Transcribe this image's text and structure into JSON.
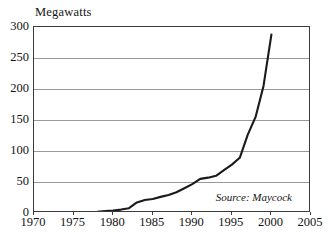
{
  "chart_data": {
    "type": "line",
    "title": "Megawatts",
    "xlabel": "",
    "ylabel": "Megawatts",
    "xlim": [
      1970,
      2005
    ],
    "ylim": [
      0,
      300
    ],
    "grid": true,
    "legend": false,
    "annotation": "Source: Maycock",
    "y_ticks": [
      300,
      250,
      200,
      150,
      100,
      50,
      0
    ],
    "x_ticks": [
      1970,
      1975,
      1980,
      1985,
      1990,
      1995,
      2000,
      2005
    ],
    "series": [
      {
        "name": "World Photovoltaic Production",
        "x": [
          1970,
          1971,
          1972,
          1973,
          1974,
          1975,
          1976,
          1977,
          1978,
          1979,
          1980,
          1981,
          1982,
          1983,
          1984,
          1985,
          1986,
          1987,
          1988,
          1989,
          1990,
          1991,
          1992,
          1993,
          1994,
          1995,
          1996,
          1997,
          1998,
          1999,
          2000
        ],
        "values": [
          0.1,
          0.2,
          0.3,
          0.4,
          0.5,
          0.7,
          1.0,
          1.5,
          2.0,
          3.0,
          4.0,
          5.5,
          7.8,
          17.0,
          21.0,
          22.5,
          26.0,
          29.0,
          33.5,
          40.0,
          46.5,
          55.0,
          57.0,
          60.0,
          69.0,
          78.0,
          89.0,
          126.0,
          155.0,
          205.0,
          288.0
        ]
      }
    ]
  },
  "axes": {
    "y_tick_labels": [
      "300",
      "250",
      "200",
      "150",
      "100",
      "50",
      "0"
    ],
    "x_tick_labels": [
      "1970",
      "1975",
      "1980",
      "1985",
      "1990",
      "1995",
      "2000",
      "2005"
    ]
  },
  "labels": {
    "title": "Megawatts",
    "source": "Source: Maycock"
  },
  "colors": {
    "series_line": "#1a1a1a",
    "gridline": "#9a9a9a",
    "frame": "#3b3b3b",
    "background": "#ffffff",
    "text": "#141414"
  }
}
